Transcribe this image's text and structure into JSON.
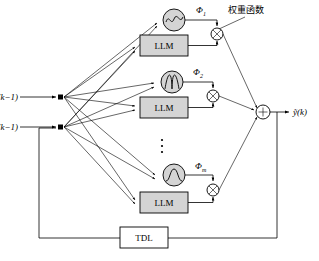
{
  "diagram": {
    "inputs": [
      {
        "id": "x",
        "label": "x(k−1)"
      },
      {
        "id": "yhat",
        "label": "ŷ(k−1)"
      }
    ],
    "output": {
      "id": "yout",
      "label": "ỹ(k)"
    },
    "annotation": {
      "id": "weight-function",
      "label": "权重函数"
    },
    "branches": [
      {
        "id": "branch-1",
        "phi_label": "Φ",
        "phi_subscript": "1",
        "block_label": "LLM",
        "activation": "sine-wave",
        "multiplier": "⊗"
      },
      {
        "id": "branch-2",
        "phi_label": "Φ",
        "phi_subscript": "2",
        "block_label": "LLM",
        "activation": "gaussian-bell",
        "multiplier": "⊗"
      },
      {
        "id": "branch-m",
        "phi_label": "Φ",
        "phi_subscript": "m",
        "block_label": "LLM",
        "activation": "sigmoid",
        "multiplier": "⊗"
      }
    ],
    "ellipsis": "⋮",
    "summer": {
      "id": "summation-node",
      "label": "+"
    },
    "feedback": {
      "id": "tdl",
      "label": "TDL"
    },
    "colors": {
      "block_fill": "#d4d4d4",
      "stroke": "#000000",
      "background": "#ffffff",
      "tdl_fill": "#ffffff"
    }
  }
}
